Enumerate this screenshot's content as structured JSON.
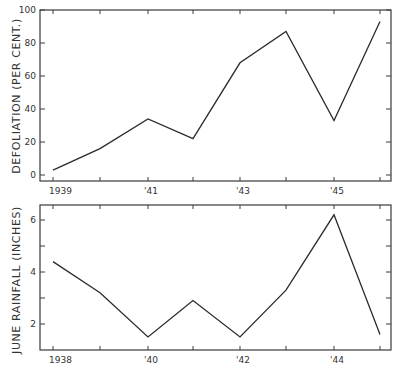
{
  "chart_data": [
    {
      "type": "line",
      "title": "",
      "xlabel": "",
      "ylabel": "DEFOLIATION (PER CENT.)",
      "x": [
        1939,
        1940,
        1941,
        1942,
        1943,
        1944,
        1945,
        1946
      ],
      "x_tick_labels": [
        "1939",
        "",
        "'41",
        "",
        "'43",
        "",
        "'45",
        ""
      ],
      "series": [
        {
          "name": "Defoliation",
          "values": [
            3,
            16,
            34,
            22,
            68,
            87,
            33,
            93
          ]
        }
      ],
      "y_ticks": [
        0,
        20,
        40,
        60,
        80,
        100
      ],
      "y_tick_labels": [
        "0",
        "20",
        "40",
        "60",
        "80",
        "100"
      ],
      "ylim": [
        0,
        100
      ],
      "grid": false,
      "legend": null
    },
    {
      "type": "line",
      "title": "",
      "xlabel": "",
      "ylabel": "JUNE RAINFALL (INCHES)",
      "x": [
        1938,
        1939,
        1940,
        1941,
        1942,
        1943,
        1944,
        1945
      ],
      "x_tick_labels": [
        "1938",
        "",
        "'40",
        "",
        "'42",
        "",
        "'44",
        ""
      ],
      "series": [
        {
          "name": "June Rainfall",
          "values": [
            4.4,
            3.2,
            1.5,
            2.9,
            1.5,
            3.3,
            6.2,
            1.6
          ]
        }
      ],
      "y_ticks": [
        2,
        3,
        4,
        5,
        6
      ],
      "y_tick_labels": [
        "2",
        "",
        "4",
        "",
        "6"
      ],
      "ylim": [
        1,
        6.6
      ],
      "grid": false,
      "legend": null
    }
  ],
  "panels": {
    "top": {
      "ylabel": "DEFOLIATION (PER CENT.)",
      "y_tick_labels": [
        "0",
        "20",
        "40",
        "60",
        "80",
        "100"
      ],
      "x_tick_labels": [
        "1939",
        "'41",
        "'43",
        "'45"
      ]
    },
    "bottom": {
      "ylabel": "JUNE RAINFALL (INCHES)",
      "y_tick_labels": [
        "2",
        "4",
        "6"
      ],
      "x_tick_labels": [
        "1938",
        "'40",
        "'42",
        "'44"
      ]
    }
  }
}
